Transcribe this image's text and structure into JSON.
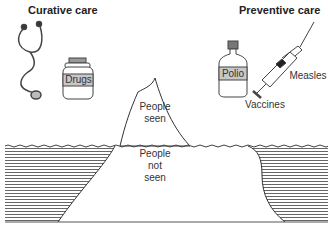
{
  "titles": {
    "curative": "Curative care",
    "preventive": "Preventive care"
  },
  "labels": {
    "drugs": "Drugs",
    "polio": "Polio",
    "measles": "Measles",
    "vaccines": "Vaccines",
    "people_seen_1": "People",
    "people_seen_2": "seen",
    "people_not_seen_1": "People",
    "people_not_seen_2": "not",
    "people_not_seen_3": "seen"
  },
  "icons": [
    "stethoscope-icon",
    "drug-jar-icon",
    "vaccine-bottle-icon",
    "syringe-icon",
    "iceberg"
  ],
  "colors": {
    "line": "#333333",
    "hatch": "#666666",
    "label_band": "#c8c8c8"
  }
}
